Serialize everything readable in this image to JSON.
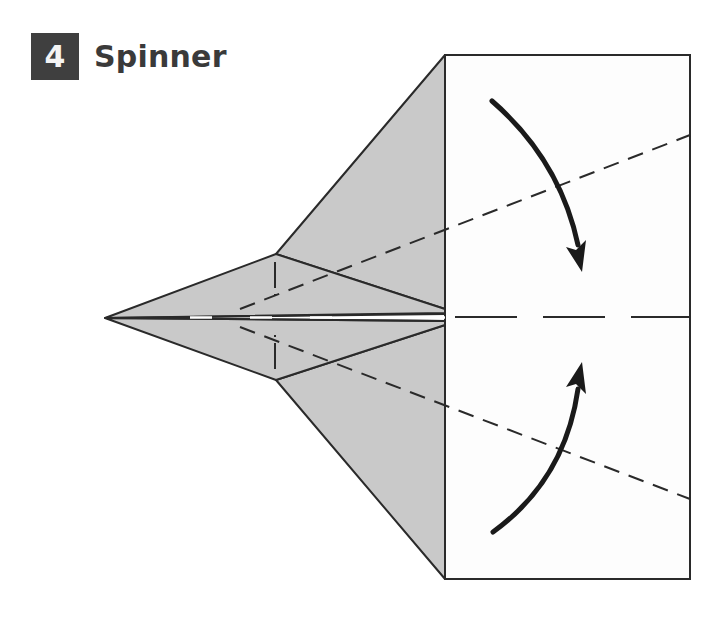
{
  "step": {
    "number": "4",
    "title": "Spinner"
  },
  "colors": {
    "paper_gray": "#c9c9c9",
    "paper_white": "#fdfdfd",
    "line": "#2a2a2a",
    "header_box": "#3f3f3f"
  }
}
